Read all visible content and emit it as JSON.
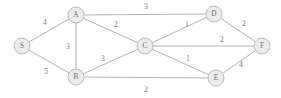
{
  "figure": {
    "background_color": "#ffffff",
    "node_fill_color": "#ebebeb",
    "node_stroke_color": "#b4b4b4",
    "edge_color": "#a9a9a9",
    "label_color": "#6e6e6e",
    "weight_color": "#7a7a7a"
  },
  "chart_data": {
    "type": "diagram",
    "nodes": [
      {
        "id": "S",
        "label": "S",
        "x": 22,
        "y": 46,
        "r": 8
      },
      {
        "id": "A",
        "label": "A",
        "x": 76,
        "y": 15,
        "r": 8
      },
      {
        "id": "B",
        "label": "B",
        "x": 76,
        "y": 77,
        "r": 8
      },
      {
        "id": "C",
        "label": "C",
        "x": 145,
        "y": 46,
        "r": 8
      },
      {
        "id": "D",
        "label": "D",
        "x": 214,
        "y": 14,
        "r": 8
      },
      {
        "id": "E",
        "label": "E",
        "x": 216,
        "y": 78,
        "r": 8
      },
      {
        "id": "F",
        "label": "F",
        "x": 262,
        "y": 46,
        "r": 8
      }
    ],
    "edges": [
      {
        "from": "S",
        "to": "A",
        "weight": "4",
        "lx": 45,
        "ly": 22
      },
      {
        "from": "S",
        "to": "B",
        "weight": "5",
        "lx": 46,
        "ly": 71
      },
      {
        "from": "A",
        "to": "B",
        "weight": "3",
        "lx": 68,
        "ly": 46
      },
      {
        "from": "A",
        "to": "C",
        "weight": "2",
        "lx": 116,
        "ly": 24
      },
      {
        "from": "A",
        "to": "D",
        "weight": "3",
        "lx": 146,
        "ly": 6
      },
      {
        "from": "B",
        "to": "C",
        "weight": "3",
        "lx": 103,
        "ly": 58
      },
      {
        "from": "B",
        "to": "E",
        "weight": "2",
        "lx": 146,
        "ly": 89
      },
      {
        "from": "C",
        "to": "D",
        "weight": "1",
        "lx": 187,
        "ly": 24
      },
      {
        "from": "C",
        "to": "E",
        "weight": "1",
        "lx": 188,
        "ly": 58
      },
      {
        "from": "C",
        "to": "F",
        "weight": "2",
        "lx": 222,
        "ly": 39
      },
      {
        "from": "D",
        "to": "F",
        "weight": "2",
        "lx": 244,
        "ly": 23
      },
      {
        "from": "E",
        "to": "F",
        "weight": "4",
        "lx": 241,
        "ly": 64
      }
    ],
    "xlim": [
      0,
      281
    ],
    "ylim": [
      0,
      98
    ],
    "grid": false,
    "legend": null
  }
}
